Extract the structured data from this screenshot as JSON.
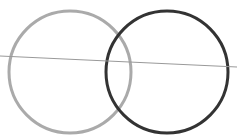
{
  "diagram": {
    "type": "venn-with-line",
    "canvas": {
      "width": 237,
      "height": 137,
      "background": "#ffffff"
    },
    "circles": [
      {
        "name": "left-circle",
        "cx": 70,
        "cy": 72,
        "r": 61,
        "stroke": "#aaaaaa",
        "stroke_width": 3
      },
      {
        "name": "right-circle",
        "cx": 167,
        "cy": 72,
        "r": 61,
        "stroke": "#333333",
        "stroke_width": 3
      }
    ],
    "line": {
      "x1": 0,
      "y1": 56,
      "x2": 237,
      "y2": 67,
      "stroke": "#999999",
      "stroke_width": 1
    }
  }
}
